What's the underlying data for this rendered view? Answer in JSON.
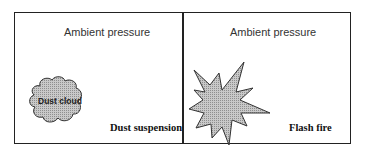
{
  "panels": [
    {
      "title": "Ambient pressure",
      "shape": "cloud",
      "shape_label": "Dust cloud",
      "caption": "Dust suspension"
    },
    {
      "title": "Ambient pressure",
      "shape": "starburst",
      "caption": "Flash fire"
    }
  ],
  "colors": {
    "border": "#222222",
    "shape_fill": "#a8a8a8",
    "shape_stroke": "#333333"
  }
}
